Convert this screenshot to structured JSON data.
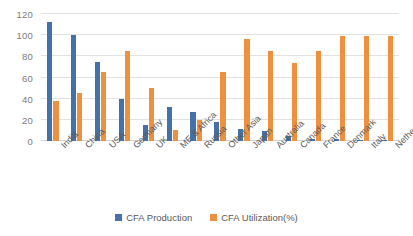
{
  "chart_data": {
    "type": "bar",
    "title": "",
    "xlabel": "",
    "ylabel": "",
    "ylim": [
      0,
      120
    ],
    "yticks": [
      0,
      20,
      40,
      60,
      80,
      100,
      120
    ],
    "grid": true,
    "legend_position": "bottom",
    "categories": [
      "India",
      "China",
      "USA",
      "Germany",
      "UK",
      "ME & Africa",
      "Russia",
      "Other Asia",
      "Japan",
      "Australia",
      "Canada",
      "France",
      "Denmark",
      "Italy",
      "Netherlands"
    ],
    "series": [
      {
        "name": "CFA Production",
        "color": "#4472a8",
        "values": [
          112,
          100,
          75,
          40,
          15,
          32,
          27,
          18,
          11,
          9,
          5,
          2,
          2,
          1,
          1
        ]
      },
      {
        "name": "CFA Utilization(%)",
        "color": "#ed9141",
        "values": [
          38,
          45,
          65,
          85,
          50,
          10,
          20,
          65,
          96,
          85,
          74,
          85,
          99,
          99,
          99
        ]
      }
    ]
  },
  "legend": {
    "entries": [
      {
        "label": "CFA Production"
      },
      {
        "label": "CFA Utilization(%)"
      }
    ]
  },
  "colors": {
    "series_0": "#4472a8",
    "series_1": "#ed9141",
    "gridline": "#e2e2e2",
    "axis_text": "#7b7b7b",
    "background": "#ffffff"
  }
}
